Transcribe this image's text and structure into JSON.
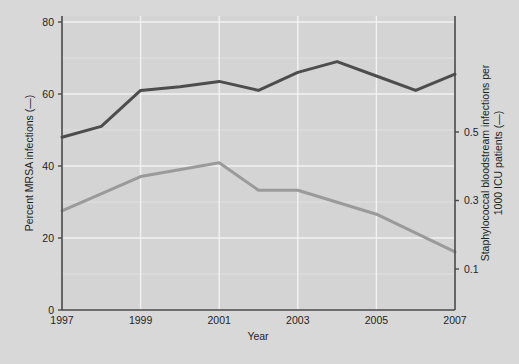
{
  "chart_data": {
    "type": "line",
    "title": "",
    "xlabel": "Year",
    "x": [
      1997,
      1998,
      1999,
      2000,
      2001,
      2002,
      2003,
      2004,
      2005,
      2006,
      2007
    ],
    "xtick_labels": [
      "1997",
      "1999",
      "2001",
      "2003",
      "2005",
      "2007"
    ],
    "xtick_values": [
      1997,
      1999,
      2001,
      2003,
      2005,
      2007
    ],
    "xlim": [
      1997,
      2007
    ],
    "grid": "vertical-and-horizontal-white",
    "legend": "inline-in-axis-titles",
    "left_axis": {
      "label": "Percent MRSA infections (—)",
      "ticks": [
        0,
        20,
        40,
        60,
        80
      ],
      "tick_labels": [
        "0",
        "20",
        "40",
        "60",
        "80"
      ],
      "ylim": [
        0,
        85
      ],
      "color": "#4d4d4d"
    },
    "right_axis": {
      "label": "Staphylococcal bloodstream infections per 1000 ICU patients (—)",
      "ticks": [
        0.1,
        0.3,
        0.5
      ],
      "tick_labels": [
        "0.1",
        "0.3",
        "0.5"
      ],
      "ylim": [
        0.0,
        0.68
      ],
      "color": "#9a9a9a"
    },
    "series": [
      {
        "name": "Percent MRSA infections",
        "axis": "left",
        "color": "#4d4d4d",
        "width": 3,
        "x": [
          1997,
          1998,
          1999,
          2000,
          2001,
          2002,
          2003,
          2004,
          2005,
          2006,
          2007
        ],
        "values": [
          48,
          51,
          61,
          62,
          63.5,
          61,
          66,
          69,
          65,
          61,
          65.5
        ]
      },
      {
        "name": "Staphylococcal bloodstream infections per 1000 ICU patients",
        "axis": "right",
        "color": "#9a9a9a",
        "width": 3,
        "x": [
          1997,
          1999,
          2001,
          2002,
          2003,
          2005,
          2007
        ],
        "values": [
          0.27,
          0.37,
          0.41,
          0.33,
          0.33,
          0.26,
          0.15
        ]
      }
    ]
  },
  "figure": {
    "background_color": "#d8d8d8",
    "plot_background_color": "#d4d4d4",
    "gridline_color": "#f2f2f2",
    "axis_color": "#4a4a4a"
  }
}
